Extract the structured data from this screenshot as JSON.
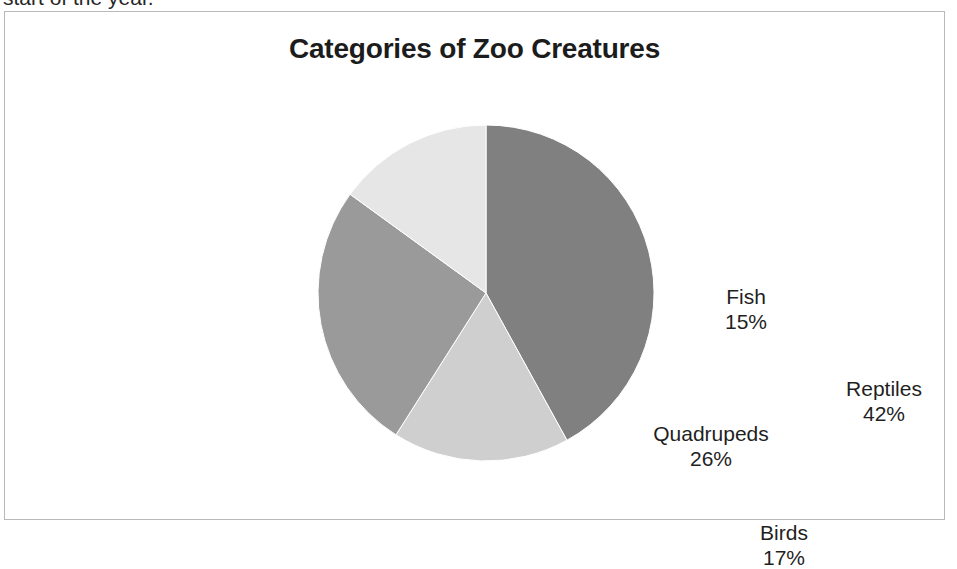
{
  "document": {
    "preceding_text": "start of the year."
  },
  "chart_frame": {
    "border_color": "#b9b9b9",
    "background": "#ffffff"
  },
  "chart_data": {
    "type": "pie",
    "title": "Categories of Zoo Creatures",
    "xlabel": "",
    "ylabel": "",
    "legend": "none",
    "grid": false,
    "start_angle_deg": 0,
    "direction": "clockwise",
    "labels_inside_slices": true,
    "categories": [
      "Reptiles",
      "Birds",
      "Quadrupeds",
      "Fish"
    ],
    "values": [
      42,
      17,
      26,
      15
    ],
    "value_unit": "%",
    "total": 100,
    "slices": [
      {
        "label": "Reptiles",
        "value": 42,
        "value_text": "42%",
        "color": "#808080"
      },
      {
        "label": "Birds",
        "value": 17,
        "value_text": "17%",
        "color": "#cfcfcf"
      },
      {
        "label": "Quadrupeds",
        "value": 26,
        "value_text": "26%",
        "color": "#9a9a9a"
      },
      {
        "label": "Fish",
        "value": 15,
        "value_text": "15%",
        "color": "#e6e6e6"
      }
    ]
  }
}
